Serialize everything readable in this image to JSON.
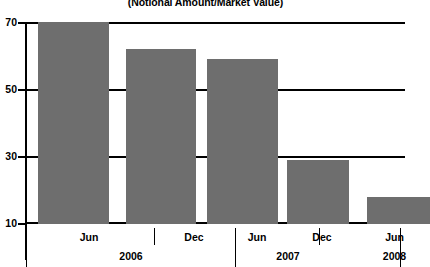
{
  "chart_data": {
    "type": "bar",
    "title": "(Notional Amount/Market Value)",
    "title_clipped_line": "Credit Default Swaps",
    "xlabel": "",
    "ylabel": "",
    "ylim": [
      10,
      70
    ],
    "yticks": [
      10,
      30,
      50,
      70
    ],
    "ytick_labels": [
      "10",
      "30",
      "50",
      "70"
    ],
    "grid": true,
    "legend": "none",
    "bar_color": "#6e6e6e",
    "axis_color": "#000000",
    "categories": [
      "Jun",
      "Dec",
      "Jun",
      "Dec",
      "Jun"
    ],
    "group_labels": [
      "2006",
      "2007",
      "2008"
    ],
    "groups": [
      {
        "year": "2006",
        "months": [
          "Jun",
          "Dec"
        ]
      },
      {
        "year": "2007",
        "months": [
          "Jun",
          "Dec"
        ]
      },
      {
        "year": "2008",
        "months": [
          "Jun"
        ]
      }
    ],
    "values": [
      70,
      62,
      59,
      29,
      18
    ],
    "points": [
      {
        "period": "Jun 2006",
        "month": "Jun",
        "year": "2006",
        "value": 70
      },
      {
        "period": "Dec 2006",
        "month": "Dec",
        "year": "2006",
        "value": 62
      },
      {
        "period": "Jun 2007",
        "month": "Jun",
        "year": "2007",
        "value": 59
      },
      {
        "period": "Dec 2007",
        "month": "Dec",
        "year": "2007",
        "value": 29
      },
      {
        "period": "Jun 2008",
        "month": "Jun",
        "year": "2008",
        "value": 18
      }
    ]
  },
  "axis": {
    "y": {
      "tick_70": "70",
      "tick_50": "50",
      "tick_30": "30",
      "tick_10": "10"
    },
    "x": {
      "m0": "Jun",
      "m1": "Dec",
      "m2": "Jun",
      "m3": "Dec",
      "m4": "Jun",
      "y0": "2006",
      "y1": "2007",
      "y2": "2008"
    }
  },
  "header": {
    "title": "(Notional Amount/Market Value)"
  }
}
